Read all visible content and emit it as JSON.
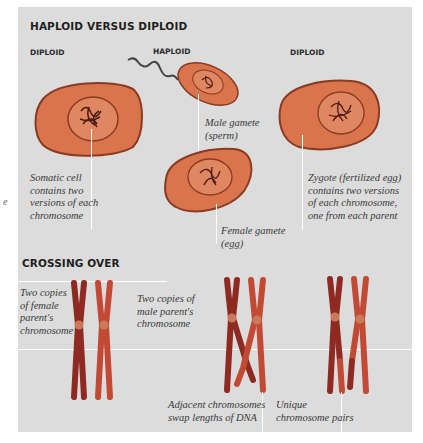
{
  "sections": {
    "haploid_vs_diploid": {
      "title": "HAPLOID VERSUS DIPLOID",
      "columns": [
        "DIPLOID",
        "HAPLOID",
        "DIPLOID"
      ],
      "captions": {
        "somatic": "Somatic cell\ncontains two\nversions of each\nchromosome",
        "sperm": "Male gamete\n(sperm)",
        "egg": "Female gamete\n(egg)",
        "zygote": "Zygote (fertilized egg)\ncontains two versions\nof each chromosome,\none from each parent"
      }
    },
    "crossing_over": {
      "title": "CROSSING OVER",
      "captions": {
        "female": "Two copies\nof female\nparent's\nchromosome",
        "male": "Two copies of\nmale parent's\nchromosome",
        "swap": "Adjacent chromosomes\nswap lengths of DNA",
        "unique": "Unique\nchromosome pairs"
      }
    }
  },
  "left_fragment": "e",
  "colors": {
    "panel_bg": "#dcdcdc",
    "cell_fill": "#d9744c",
    "cell_outline": "#8a3a22",
    "nucleus_fill": "#e08660",
    "chromatin": "#4a1c14",
    "female_chromosome": "#8e2a22",
    "male_chromosome": "#c24a34",
    "centromere": "#c87a5a"
  }
}
